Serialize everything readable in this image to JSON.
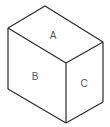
{
  "diagram": {
    "type": "isometric-box",
    "faces": [
      {
        "id": "top",
        "label": "A"
      },
      {
        "id": "left",
        "label": "B"
      },
      {
        "id": "right",
        "label": "C"
      }
    ],
    "colors": {
      "stroke": "#2a2a2a",
      "label": "#555555",
      "background": "#ffffff"
    }
  }
}
